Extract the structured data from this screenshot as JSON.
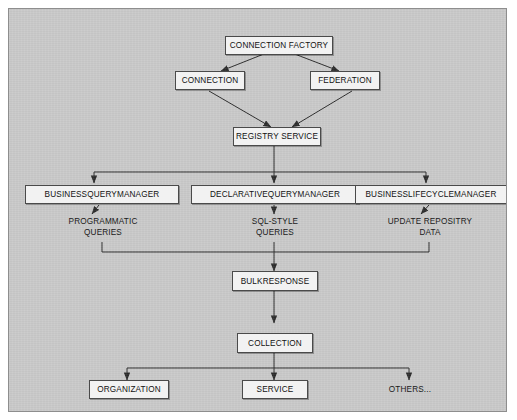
{
  "diagram": {
    "background_color": "#c9c9c9",
    "node_fill": "#f2f2f2",
    "node_border": "#4a4a4a",
    "frame_border": "#8e8e8e",
    "nodes": [
      {
        "id": "connection-factory",
        "label": "CONNECTION FACTORY"
      },
      {
        "id": "connection",
        "label": "CONNECTION"
      },
      {
        "id": "federation",
        "label": "FEDERATION"
      },
      {
        "id": "registry-service",
        "label": "REGISTRY SERVICE"
      },
      {
        "id": "businessquerymanager",
        "label": "BUSINESSQUERYMANAGER"
      },
      {
        "id": "declarativequerymanager",
        "label": "DECLARATIVEQUERYMANAGER"
      },
      {
        "id": "businesslifecyclemanager",
        "label": "BUSINESSLIFECYCLEMANAGER"
      },
      {
        "id": "bulkresponse",
        "label": "BULKRESPONSE"
      },
      {
        "id": "collection",
        "label": "COLLECTION"
      },
      {
        "id": "organization",
        "label": "ORGANIZATION"
      },
      {
        "id": "service",
        "label": "SERVICE"
      }
    ],
    "labels": [
      {
        "id": "programmatic-queries",
        "label": "PROGRAMMATIC\nQUERIES"
      },
      {
        "id": "sql-style-queries",
        "label": "SQL-STYLE\nQUERIES"
      },
      {
        "id": "update-repository-data",
        "label": "UPDATE REPOSITRY\nDATA"
      },
      {
        "id": "others",
        "label": "OTHERS..."
      }
    ]
  }
}
